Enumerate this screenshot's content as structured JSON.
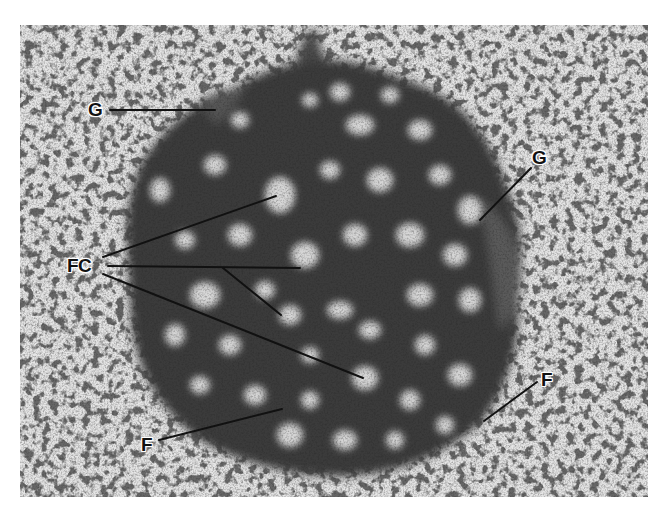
{
  "figure": {
    "type": "electron-micrograph",
    "colors": {
      "background_cytoplasm": "#e4e4e4",
      "nucleolus_dense": "#3a3a3a",
      "fibrillar_center": "#d8d8d8",
      "label_text": "#111111",
      "leader_line": "#111111",
      "page": "#ffffff"
    },
    "labels": [
      {
        "id": "G_top_left",
        "text": "G",
        "x": 88,
        "y": 100
      },
      {
        "id": "G_right",
        "text": "G",
        "x": 532,
        "y": 148
      },
      {
        "id": "FC_left",
        "text": "FC",
        "x": 67,
        "y": 256
      },
      {
        "id": "F_right",
        "text": "F",
        "x": 541,
        "y": 370
      },
      {
        "id": "F_bottom_left",
        "text": "F",
        "x": 141,
        "y": 435
      }
    ],
    "leader_lines": [
      {
        "from_label": "G_top_left",
        "x1": 110,
        "y1": 110,
        "x2": 215,
        "y2": 110
      },
      {
        "from_label": "G_right",
        "x1": 531,
        "y1": 168,
        "x2": 480,
        "y2": 220
      },
      {
        "from_label": "FC_left",
        "x1": 103,
        "y1": 257,
        "x2": 276,
        "y2": 196
      },
      {
        "from_label": "FC_left",
        "x1": 108,
        "y1": 266,
        "x2": 300,
        "y2": 268
      },
      {
        "from_label": "FC_left",
        "x1": 223,
        "y1": 268,
        "x2": 281,
        "y2": 315
      },
      {
        "from_label": "FC_left",
        "x1": 103,
        "y1": 274,
        "x2": 363,
        "y2": 378
      },
      {
        "from_label": "F_right",
        "x1": 537,
        "y1": 382,
        "x2": 484,
        "y2": 421
      },
      {
        "from_label": "F_bottom_left",
        "x1": 159,
        "y1": 440,
        "x2": 282,
        "y2": 409
      }
    ]
  }
}
